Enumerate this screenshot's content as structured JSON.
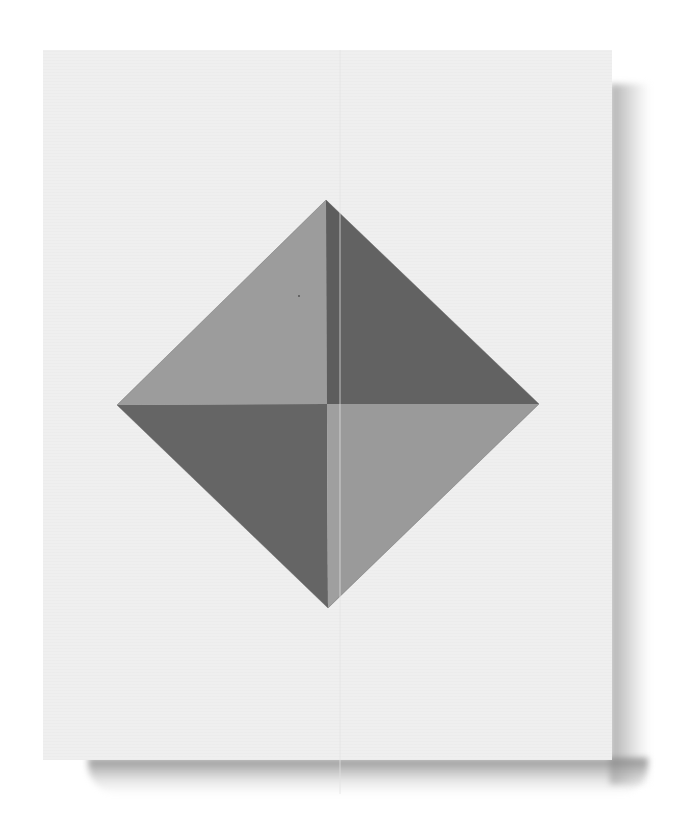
{
  "scene": {
    "description": "Flat printed sheet with a geometric diamond composed of four triangles in alternating light and dark gray",
    "background_color": "#ffffff",
    "sheet_color": "#efefef",
    "shadow_color": "#9a9a9a"
  },
  "diamond": {
    "top": [
      326,
      200
    ],
    "right": [
      539,
      404
    ],
    "bottom": [
      328,
      608
    ],
    "left": [
      117,
      405
    ],
    "center": [
      327,
      404
    ],
    "quadrants": [
      {
        "name": "upper-left",
        "color": "#9c9c9c"
      },
      {
        "name": "upper-right",
        "color": "#626262"
      },
      {
        "name": "lower-left",
        "color": "#656565"
      },
      {
        "name": "lower-right",
        "color": "#9a9a9a"
      }
    ],
    "inner_strip_color": "#5c5c5c",
    "seam_line_color": "#d8d8d8"
  }
}
